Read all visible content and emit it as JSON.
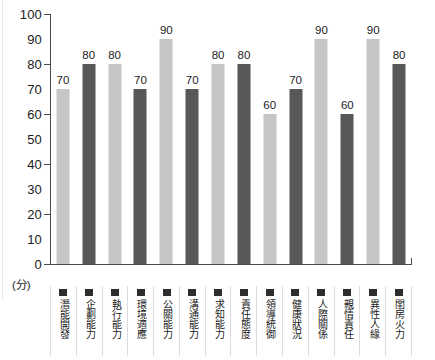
{
  "chart_data": {
    "type": "bar",
    "title": "",
    "subtitle": "",
    "xlabel": "",
    "ylabel": "(分)",
    "ylim": [
      0,
      100
    ],
    "ytick_step": 10,
    "ytick_labels": [
      "100",
      "90",
      "80",
      "70",
      "60",
      "50",
      "40",
      "30",
      "20",
      "10",
      "0"
    ],
    "ytick_values": [
      100,
      90,
      80,
      70,
      60,
      50,
      40,
      30,
      20,
      10,
      0
    ],
    "major_ticks": [
      100,
      80,
      60,
      40,
      20,
      0
    ],
    "grid": false,
    "legend": "none",
    "categories": [
      "潛能開發",
      "企劃能力",
      "執行能力",
      "環境適應",
      "公關能力",
      "溝通能力",
      "求知能力",
      "責任態度",
      "領導統御",
      "健康狀況",
      "人際關係",
      "親情責任",
      "異性人緣",
      "閨房火力"
    ],
    "values": [
      70,
      80,
      80,
      70,
      90,
      70,
      80,
      80,
      60,
      70,
      90,
      60,
      90,
      80
    ],
    "value_labels": [
      "70",
      "80",
      "80",
      "70",
      "90",
      "70",
      "80",
      "80",
      "60",
      "70",
      "90",
      "60",
      "90",
      "80"
    ],
    "bar_styles": [
      "light",
      "dark",
      "light",
      "dark",
      "light",
      "dark",
      "light",
      "dark",
      "light",
      "dark",
      "light",
      "dark",
      "light",
      "dark"
    ],
    "colors": {
      "light_bar": "#c6c6c6",
      "dark_bar": "#585858",
      "axis": "#4a4a4a",
      "text": "#1c1c1c",
      "legend_swatch": "#2e2e2e",
      "cell_border": "#dcdcdc",
      "background": "#ffffff"
    },
    "legend_swatch_name": "square-marker"
  }
}
